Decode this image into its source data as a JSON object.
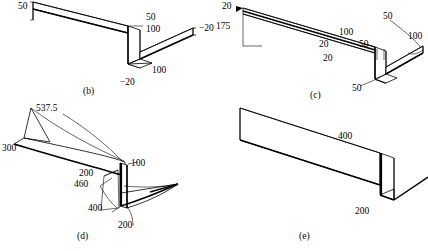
{
  "figure": {
    "panels": [
      {
        "id": "b",
        "caption": "(b)",
        "labels": [
          {
            "name": "dim-50-left",
            "text": "50",
            "x": 18,
            "y": 6
          },
          {
            "name": "dim-50-mid",
            "text": "50",
            "x": 146,
            "y": 17
          },
          {
            "name": "dim-100-upper",
            "text": "100",
            "x": 146,
            "y": 29
          },
          {
            "name": "dim-neg20-right",
            "text": "−20",
            "x": 200,
            "y": 41
          },
          {
            "name": "dim-100-lower",
            "text": "100",
            "x": 154,
            "y": 71
          },
          {
            "name": "dim-neg20-bottom",
            "text": "−20",
            "x": 121,
            "y": 83
          }
        ]
      },
      {
        "id": "c",
        "caption": "(c)",
        "labels": [
          {
            "name": "dim-20-topleft",
            "text": "20",
            "x": 222,
            "y": 6
          },
          {
            "name": "dim-175-left",
            "text": "175",
            "x": 218,
            "y": 26
          },
          {
            "name": "dim-20-upper",
            "text": "20",
            "x": 319,
            "y": 44
          },
          {
            "name": "dim-20-lower",
            "text": "20",
            "x": 323,
            "y": 58
          },
          {
            "name": "dim-100-mid",
            "text": "100",
            "x": 340,
            "y": 32
          },
          {
            "name": "dim-50-mid",
            "text": "50",
            "x": 359,
            "y": 44
          },
          {
            "name": "dim-50-upperright",
            "text": "50",
            "x": 384,
            "y": 20
          },
          {
            "name": "dim-100-right",
            "text": "100",
            "x": 409,
            "y": 38
          },
          {
            "name": "dim-50-bottom",
            "text": "50",
            "x": 353,
            "y": 86
          }
        ]
      },
      {
        "id": "d",
        "caption": "(d)",
        "labels": [
          {
            "name": "dim-537p5",
            "text": "537.5",
            "x": 36,
            "y": 108
          },
          {
            "name": "dim-300",
            "text": "300",
            "x": 3,
            "y": 148
          },
          {
            "name": "dim-200-upper",
            "text": "200",
            "x": 79,
            "y": 172
          },
          {
            "name": "dim-460",
            "text": "460",
            "x": 75,
            "y": 183
          },
          {
            "name": "dim-100",
            "text": "100",
            "x": 131,
            "y": 163
          },
          {
            "name": "dim-400",
            "text": "400",
            "x": 90,
            "y": 207
          },
          {
            "name": "dim-200-lower",
            "text": "200",
            "x": 119,
            "y": 225
          }
        ]
      },
      {
        "id": "e",
        "caption": "(e)",
        "labels": [
          {
            "name": "dim-400",
            "text": "400",
            "x": 339,
            "y": 136
          },
          {
            "name": "dim-200",
            "text": "200",
            "x": 356,
            "y": 212
          }
        ]
      }
    ],
    "captions": [
      {
        "name": "caption-b",
        "text": "(b)",
        "x": 83,
        "y": 89
      },
      {
        "name": "caption-c",
        "text": "(c)",
        "x": 310,
        "y": 93
      },
      {
        "name": "caption-d",
        "text": "(d)",
        "x": 77,
        "y": 234
      },
      {
        "name": "caption-e",
        "text": "(e)",
        "x": 299,
        "y": 234
      }
    ],
    "colors": {
      "stroke": "#000000",
      "fill": "#ffffff",
      "background": "#ffffff"
    }
  }
}
